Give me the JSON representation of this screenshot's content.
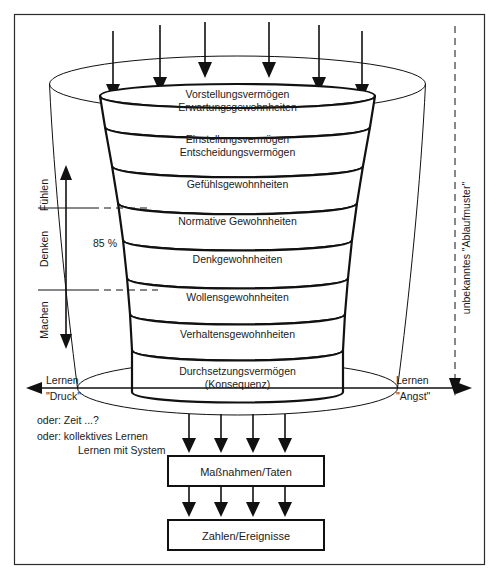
{
  "funnel": {
    "bands": [
      {
        "lines": [
          "Vorstellungsvermögen",
          "Erwartungsgewohnheiten"
        ]
      },
      {
        "lines": [
          "Einstellungsvermögen",
          "Entscheidungsvermögen"
        ]
      },
      {
        "lines": [
          "Gefühlsgewohnheiten"
        ]
      },
      {
        "lines": [
          "Normative Gewohnheiten"
        ]
      },
      {
        "lines": [
          "Denkgewohnheiten"
        ]
      },
      {
        "lines": [
          "Wollensgewohnheiten"
        ]
      },
      {
        "lines": [
          "Verhaltensgewohnheiten"
        ]
      },
      {
        "lines": [
          "Durchsetzungsvermögen",
          "(Konsequenz)"
        ]
      }
    ],
    "percent_label": "85 %"
  },
  "axis": {
    "levels": [
      "Fühlen",
      "Denken",
      "Machen"
    ]
  },
  "left_arrow": {
    "line1": "Lernen",
    "line2": "\"Druck\""
  },
  "right_arrow": {
    "line1": "Lernen",
    "line2": "\"Angst\""
  },
  "right_vertical": {
    "label": "unbekanntes \"Ablaufmuster\""
  },
  "notes": [
    "oder: Zeit ...?",
    "oder: kollektives Lernen",
    "Lernen mit System"
  ],
  "boxes": [
    {
      "label": "Maßnahmen/Taten"
    },
    {
      "label": "Zahlen/Ereignisse"
    }
  ],
  "arrows": {
    "top_count": 6,
    "bottom_count": 4,
    "between_boxes_count": 4
  },
  "colors": {
    "stroke": "#111111",
    "background": "#ffffff",
    "frame": "#2b2b2b"
  }
}
